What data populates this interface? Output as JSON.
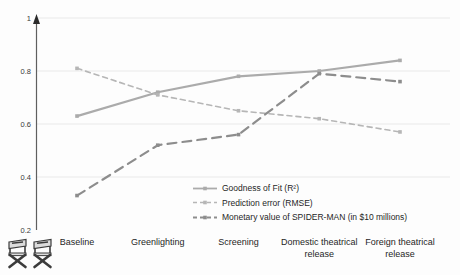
{
  "chart_data": {
    "type": "line",
    "title": "",
    "categories": [
      "Baseline",
      "Greenlighting",
      "Screening",
      "Domestic theatrical release",
      "Foreign theatrical release"
    ],
    "series": [
      {
        "name": "Goodness of Fit (R²)",
        "values": [
          0.63,
          0.72,
          0.78,
          0.8,
          0.84
        ],
        "style": "solid",
        "color": "#ababab",
        "width": 2.2,
        "dash": ""
      },
      {
        "name": "Prediction error (RMSE)",
        "values": [
          0.81,
          0.71,
          0.65,
          0.62,
          0.57
        ],
        "style": "dashed",
        "color": "#b6b6b6",
        "width": 1.6,
        "dash": "5,4"
      },
      {
        "name": "Monetary value of SPIDER-MAN (in $10 millions)",
        "values": [
          0.33,
          0.52,
          0.56,
          0.79,
          0.76
        ],
        "style": "dashed",
        "color": "#8d8d8d",
        "width": 2.2,
        "dash": "9,6"
      }
    ],
    "ylim": [
      0.2,
      1.0
    ],
    "yticks": [
      1,
      0.8,
      0.6,
      0.4,
      0.2
    ],
    "ytick_labels": [
      "1",
      "0.8",
      "0.6",
      "0.4",
      "0.2"
    ],
    "grid": true,
    "legend_position": "inside-bottom-right",
    "xlabel": "",
    "ylabel": ""
  },
  "decorations": {
    "bottom_left_icons": [
      "director-chair-icon",
      "director-chair-icon"
    ]
  },
  "colors": {
    "background": "#fdfdfd",
    "gridline": "#e9e9e9",
    "axis": "#5f5f5f",
    "axis_arrow": "#2b2b2b",
    "text": "#1f1f1f",
    "chair_dark": "#3c3c3c",
    "chair_light": "#dcdcdc"
  }
}
